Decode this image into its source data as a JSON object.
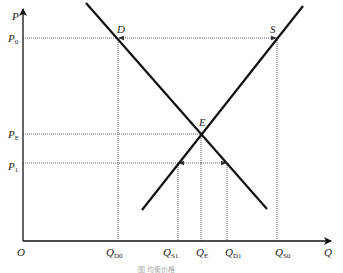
{
  "diagram": {
    "axes": {
      "y_label": "P",
      "x_label": "Q",
      "origin_label": "O"
    },
    "curves": [
      {
        "name": "demand",
        "label": "D",
        "from": [
          86,
          3
        ],
        "to": [
          267,
          209
        ]
      },
      {
        "name": "supply",
        "label": "S",
        "from": [
          142,
          210
        ],
        "to": [
          303,
          6
        ]
      }
    ],
    "equilibrium": {
      "label": "E"
    },
    "price_levels": [
      {
        "id": "p0",
        "label": "P",
        "sub": "0",
        "y": 38
      },
      {
        "id": "pe",
        "label": "P",
        "sub": "E",
        "y": 134
      },
      {
        "id": "p1",
        "label": "P",
        "sub": "1",
        "y": 163
      }
    ],
    "quantity_levels": [
      {
        "id": "qd0",
        "label": "Q",
        "sub": "D0",
        "x": 118
      },
      {
        "id": "qs1",
        "label": "Q",
        "sub": "S1",
        "x": 178
      },
      {
        "id": "qe",
        "label": "Q",
        "sub": "E",
        "x": 201
      },
      {
        "id": "qd1",
        "label": "Q",
        "sub": "D1",
        "x": 227
      },
      {
        "id": "qs0",
        "label": "Q",
        "sub": "S0",
        "x": 277
      }
    ],
    "arrows": [
      {
        "at": "P0",
        "description": "excess supply: arrows from D toward S"
      },
      {
        "at": "P1",
        "description": "excess demand: arrows from QE outward to S and D"
      }
    ],
    "caption": "图    均衡价格"
  }
}
